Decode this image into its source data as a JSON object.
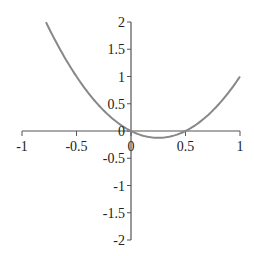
{
  "chart_data": {
    "type": "line",
    "title": "",
    "xlabel": "",
    "ylabel": "",
    "xlim": [
      -1,
      1
    ],
    "ylim": [
      -2,
      2
    ],
    "grid": false,
    "legend": null,
    "x_ticks": [
      "-1",
      "-0.5",
      "0",
      "0.5",
      "1"
    ],
    "y_ticks": [
      "2",
      "1.5",
      "1",
      "0.5",
      "0",
      "-0.5",
      "-1",
      "-1.5",
      "-2"
    ],
    "series": [
      {
        "name": "y = 2x^2 - x",
        "color": "#888888",
        "x": [
          -0.78,
          -0.7,
          -0.6,
          -0.5,
          -0.4,
          -0.3,
          -0.2,
          -0.1,
          0,
          0.1,
          0.2,
          0.25,
          0.3,
          0.4,
          0.5,
          0.6,
          0.7,
          0.8,
          0.9,
          1.0
        ],
        "y": [
          1.997,
          1.68,
          1.32,
          1.0,
          0.72,
          0.48,
          0.28,
          0.12,
          0,
          -0.08,
          -0.12,
          -0.125,
          -0.12,
          -0.08,
          0,
          0.12,
          0.28,
          0.48,
          0.72,
          1.0
        ]
      }
    ]
  },
  "colors": {
    "axis": "#555555",
    "curve": "#888888"
  }
}
